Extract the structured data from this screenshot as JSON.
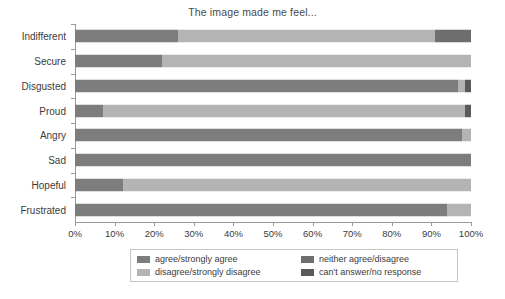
{
  "chart_data": {
    "type": "bar",
    "orientation": "horizontal",
    "stacked": true,
    "stack_mode": "percent",
    "title": "The image made me feel...",
    "xlabel": "",
    "ylabel": "",
    "xlim": [
      0,
      100
    ],
    "grid": false,
    "legend_position": "bottom",
    "tick_labels": [
      "0%",
      "10%",
      "20%",
      "30%",
      "40%",
      "50%",
      "60%",
      "70%",
      "80%",
      "90%",
      "100%"
    ],
    "tick_values": [
      0,
      10,
      20,
      30,
      40,
      50,
      60,
      70,
      80,
      90,
      100
    ],
    "categories": [
      "Indifferent",
      "Secure",
      "Disgusted",
      "Proud",
      "Angry",
      "Sad",
      "Hopeful",
      "Frustrated"
    ],
    "series": [
      {
        "name": "agree/strongly agree",
        "color": "#7d7d7d",
        "values": [
          26.0,
          22.0,
          96.8,
          7.0,
          97.8,
          100.0,
          12.0,
          94.0
        ]
      },
      {
        "name": "disagree/strongly disagree",
        "color": "#b4b4b4",
        "values": [
          65.0,
          78.0,
          1.7,
          91.5,
          2.2,
          0.0,
          88.0,
          6.0
        ]
      },
      {
        "name": "neither agree/disagree",
        "color": "#6e6e6e",
        "values": [
          9.0,
          0.0,
          0.0,
          0.0,
          0.0,
          0.0,
          0.0,
          0.0
        ]
      },
      {
        "name": "can't answer/no response",
        "color": "#5a5a5a",
        "values": [
          0.0,
          0.0,
          1.5,
          1.5,
          0.0,
          0.0,
          0.0,
          0.0
        ]
      }
    ]
  },
  "colors": {
    "agree": "#7d7d7d",
    "disagree": "#b4b4b4",
    "neither": "#6e6e6e",
    "cant_answer": "#5a5a5a",
    "axis": "#9a9a9a",
    "text": "#3c3c3c",
    "background": "#ffffff"
  }
}
